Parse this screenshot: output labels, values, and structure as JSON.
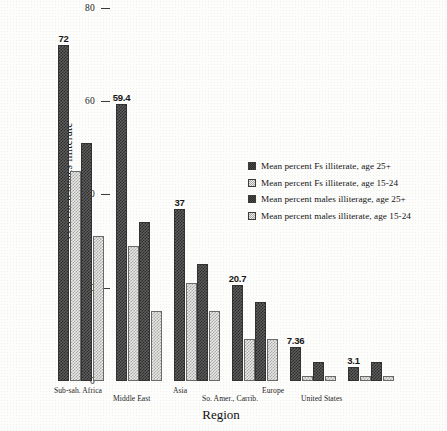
{
  "chart_data": {
    "type": "bar",
    "title": "",
    "xlabel": "Region",
    "ylabel": "Percent females illiterate",
    "ylim": [
      0,
      80
    ],
    "yticks": [
      0,
      20,
      40,
      60,
      80
    ],
    "grid": false,
    "legend_position": "center-right",
    "categories": [
      "Sub-sah. Africa",
      "Middle East",
      "Asia",
      "So. Amer., Carrib.",
      "Europe",
      "United States"
    ],
    "series": [
      {
        "name": "Mean percent Fs illiterate, age 25+",
        "swatch": "dark",
        "values": [
          72,
          59.4,
          37,
          20.7,
          7.36,
          3.1
        ],
        "labels": [
          "72",
          "59.4",
          "37",
          "20.7",
          "7.36",
          "3.1"
        ]
      },
      {
        "name": "Mean percent Fs illiterate, age 15-24",
        "swatch": "light",
        "values": [
          45,
          29,
          21,
          9,
          1,
          1
        ],
        "labels": [
          "",
          "",
          "",
          "",
          "",
          ""
        ]
      },
      {
        "name": "Mean percent males illiterage, age 25+",
        "swatch": "dark",
        "values": [
          51,
          34,
          25,
          17,
          4,
          4
        ],
        "labels": [
          "",
          "",
          "",
          "",
          "",
          ""
        ]
      },
      {
        "name": "Mean percent males illiterate, age 15-24",
        "swatch": "light",
        "values": [
          31,
          15,
          15,
          9,
          1,
          1
        ],
        "labels": [
          "",
          "",
          "",
          "",
          "",
          ""
        ]
      }
    ]
  }
}
